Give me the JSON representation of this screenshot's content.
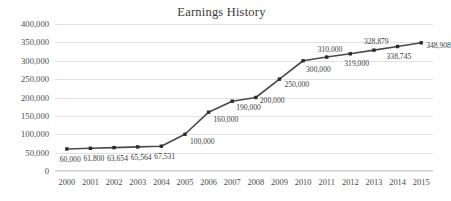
{
  "chart_data": {
    "type": "line",
    "title": "Earnings History",
    "xlabel": "",
    "ylabel": "",
    "categories": [
      "2000",
      "2001",
      "2002",
      "2003",
      "2004",
      "2005",
      "2006",
      "2007",
      "2008",
      "2009",
      "2010",
      "2011",
      "2012",
      "2013",
      "2014",
      "2015"
    ],
    "values": [
      60000,
      61800,
      63654,
      65564,
      67531,
      100000,
      160000,
      190000,
      200000,
      250000,
      300000,
      310000,
      319000,
      328879,
      338745,
      348908
    ],
    "point_labels": [
      "60,000",
      "61,800",
      "63,654",
      "65,564",
      "67,531",
      "100,000",
      "160,000",
      "190,000",
      "200,000",
      "250,000",
      "300,000",
      "310,000",
      "319,000",
      "328,879",
      "338,745",
      "348,908"
    ],
    "ylim": [
      0,
      400000
    ],
    "ytick_labels": [
      "0",
      "50,000",
      "100,000",
      "150,000",
      "200,000",
      "250,000",
      "300,000",
      "350,000",
      "400,000"
    ],
    "ytick_values": [
      0,
      50000,
      100000,
      150000,
      200000,
      250000,
      300000,
      350000,
      400000
    ],
    "grid": true,
    "legend": false,
    "series_color": "#4a4a4a",
    "marker_color": "#2b2b2b",
    "grid_color": "#e2e2e2",
    "label_color": "#3c3c3c"
  }
}
